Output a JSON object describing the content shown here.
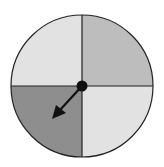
{
  "diagram": {
    "type": "spinner",
    "sections": [
      {
        "position": "top-left",
        "shade": "light",
        "color": "#e2e2e2"
      },
      {
        "position": "top-right",
        "shade": "medium",
        "color": "#bdbdbd"
      },
      {
        "position": "bottom-left",
        "shade": "dark",
        "color": "#8e8e8e"
      },
      {
        "position": "bottom-right",
        "shade": "light",
        "color": "#e2e2e2"
      }
    ],
    "arrow": {
      "points_to": "bottom-left"
    },
    "outline_color": "#222222"
  }
}
